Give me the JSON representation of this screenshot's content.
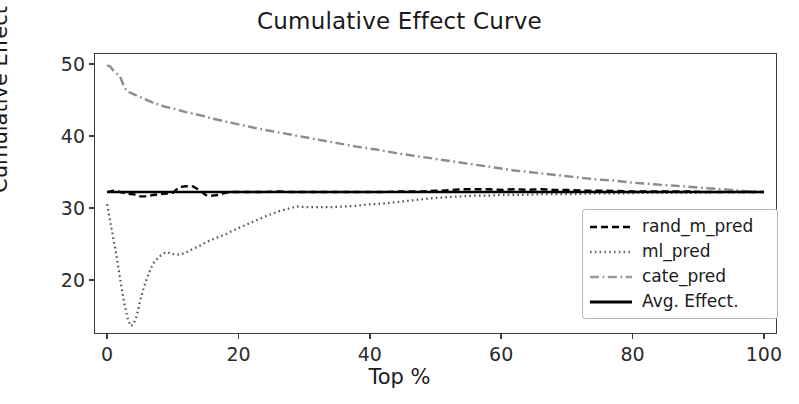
{
  "chart_data": {
    "type": "line",
    "title": "Cumulative Effect Curve",
    "xlabel": "Top %",
    "ylabel": "Cumulative Effect",
    "xlim": [
      -2,
      102
    ],
    "ylim": [
      12.5,
      51.5
    ],
    "xticks": [
      0,
      20,
      40,
      60,
      80,
      100
    ],
    "yticks": [
      20,
      30,
      40,
      50
    ],
    "grid": false,
    "legend_position": "lower right",
    "series": [
      {
        "name": "rand_m_pred",
        "style": "dashed",
        "color": "#000000",
        "x": [
          0,
          1,
          2,
          3,
          4,
          5,
          6,
          7,
          8,
          9,
          10,
          11,
          12,
          13,
          14,
          15,
          16,
          17,
          18,
          19,
          20,
          22,
          24,
          26,
          28,
          30,
          33,
          36,
          39,
          42,
          45,
          48,
          51,
          54,
          56,
          58,
          60,
          62,
          64,
          66,
          68,
          70,
          73,
          76,
          79,
          82,
          85,
          88,
          91,
          94,
          97,
          100
        ],
        "values": [
          32.2,
          32.4,
          32.2,
          32.0,
          31.9,
          31.6,
          31.6,
          31.8,
          31.9,
          32.0,
          32.1,
          32.9,
          33.0,
          33.0,
          32.5,
          31.8,
          31.7,
          31.8,
          32.1,
          32.2,
          32.2,
          32.2,
          32.2,
          32.3,
          32.2,
          32.2,
          32.2,
          32.2,
          32.2,
          32.2,
          32.3,
          32.3,
          32.4,
          32.6,
          32.6,
          32.6,
          32.5,
          32.6,
          32.5,
          32.6,
          32.5,
          32.5,
          32.4,
          32.4,
          32.3,
          32.3,
          32.3,
          32.3,
          32.2,
          32.2,
          32.2,
          32.2
        ]
      },
      {
        "name": "ml_pred",
        "style": "dotted",
        "color": "#555555",
        "x": [
          0,
          0.7,
          1.4,
          2.0,
          2.6,
          3.2,
          3.6,
          4.0,
          4.5,
          5.0,
          5.6,
          6.3,
          7.0,
          8.0,
          9.0,
          10.0,
          11.0,
          12.0,
          13.0,
          14.0,
          15.0,
          16.0,
          17.0,
          18.0,
          19.0,
          20.0,
          22.0,
          24.0,
          26.0,
          28.0,
          29.0,
          30.0,
          32.0,
          34.0,
          36.0,
          38.0,
          40.0,
          42.0,
          44.0,
          46.0,
          48.0,
          50.0,
          52.0,
          54.0,
          56.0,
          58.0,
          60.0,
          63.0,
          66.0,
          70.0,
          74.0,
          78.0,
          82.0,
          86.0,
          90.0,
          94.0,
          97.0,
          100.0
        ],
        "values": [
          30.5,
          27.0,
          23.5,
          20.0,
          16.8,
          14.4,
          13.6,
          13.8,
          15.0,
          17.0,
          19.0,
          20.8,
          22.3,
          23.3,
          23.9,
          23.6,
          23.5,
          23.8,
          24.3,
          24.7,
          25.2,
          25.6,
          26.0,
          26.3,
          26.8,
          27.2,
          28.0,
          28.8,
          29.5,
          30.0,
          30.2,
          30.1,
          30.1,
          30.1,
          30.2,
          30.3,
          30.5,
          30.6,
          30.8,
          31.0,
          31.2,
          31.4,
          31.5,
          31.6,
          31.7,
          31.7,
          31.8,
          31.8,
          31.9,
          31.9,
          32.0,
          32.0,
          32.1,
          32.1,
          32.1,
          32.2,
          32.2,
          32.2
        ]
      },
      {
        "name": "cate_pred",
        "style": "dashdot",
        "color": "#8c8c8c",
        "x": [
          0,
          0.5,
          1.0,
          1.5,
          2.0,
          2.5,
          3.0,
          3.5,
          4.0,
          5.0,
          6.0,
          7.0,
          8.0,
          9.0,
          10.0,
          12.0,
          14.0,
          16.0,
          18.0,
          20.0,
          23.0,
          26.0,
          29.0,
          32.0,
          35.0,
          38.0,
          41.0,
          44.0,
          47.0,
          50.0,
          53.0,
          56.0,
          59.0,
          62.0,
          65.0,
          68.0,
          71.0,
          74.0,
          77.0,
          80.0,
          83.0,
          86.0,
          89.0,
          92.0,
          95.0,
          98.0,
          100.0
        ],
        "values": [
          49.8,
          49.6,
          49.0,
          48.6,
          48.2,
          47.0,
          46.2,
          46.0,
          45.8,
          45.4,
          45.0,
          44.6,
          44.3,
          44.0,
          43.8,
          43.3,
          42.9,
          42.4,
          42.0,
          41.6,
          41.0,
          40.5,
          40.0,
          39.5,
          39.0,
          38.5,
          38.1,
          37.6,
          37.2,
          36.8,
          36.4,
          36.0,
          35.6,
          35.2,
          34.9,
          34.6,
          34.3,
          34.0,
          33.8,
          33.5,
          33.3,
          33.1,
          32.9,
          32.7,
          32.5,
          32.3,
          32.2
        ]
      },
      {
        "name": "Avg. Effect.",
        "style": "solid",
        "color": "#000000",
        "x": [
          0,
          100
        ],
        "values": [
          32.2,
          32.2
        ]
      }
    ]
  },
  "legend": {
    "items": [
      {
        "label": "rand_m_pred",
        "style": "dashed",
        "color": "#000000"
      },
      {
        "label": "ml_pred",
        "style": "dotted",
        "color": "#6e6e6e"
      },
      {
        "label": "cate_pred",
        "style": "dashdot",
        "color": "#9a9a9a"
      },
      {
        "label": "Avg. Effect.",
        "style": "solid",
        "color": "#000000"
      }
    ]
  },
  "axes": {
    "x_tick_labels": [
      "0",
      "20",
      "40",
      "60",
      "80",
      "100"
    ],
    "y_tick_labels": [
      "20",
      "30",
      "40",
      "50"
    ],
    "x_axis_label": "Top %",
    "y_axis_label": "Cumulative Effect"
  },
  "title": "Cumulative Effect Curve"
}
